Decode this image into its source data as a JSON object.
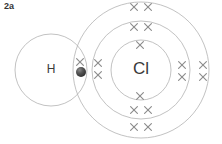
{
  "figure": {
    "label": "2a",
    "type": "dot-and-cross-diagram",
    "molecule": "HCl",
    "background_color": "#ffffff",
    "ring_color": "#b3b3b3",
    "cross_color": "#8c8c8c",
    "symbol_color": "#3a3a3a",
    "dot_color": "#4a4a4a",
    "width": 222,
    "height": 144
  },
  "atoms": [
    {
      "id": "hydrogen",
      "symbol": "H",
      "center_x": 51,
      "center_y": 70,
      "shell_radius": 36,
      "label_x": 51,
      "label_y": 70
    },
    {
      "id": "chlorine",
      "symbol": "Cl",
      "center_x": 141,
      "center_y": 70,
      "label_x": 141,
      "label_y": 70,
      "shells": [
        {
          "name": "inner-shell",
          "radius": 30
        },
        {
          "name": "middle-shell",
          "radius": 49
        },
        {
          "name": "outer-shell",
          "radius": 68
        }
      ]
    }
  ],
  "electrons": {
    "crosses": [
      {
        "name": "cross-bonding-pair",
        "x": 80,
        "y": 62,
        "shell": "outer-shell"
      },
      {
        "name": "cross-inner-top",
        "x": 140,
        "y": 45,
        "shell": "inner-shell"
      },
      {
        "name": "cross-inner-bottom",
        "x": 140,
        "y": 96,
        "shell": "inner-shell"
      },
      {
        "name": "cross-middle-top-left",
        "x": 134,
        "y": 27,
        "shell": "middle-shell"
      },
      {
        "name": "cross-middle-top-right",
        "x": 148,
        "y": 27,
        "shell": "middle-shell"
      },
      {
        "name": "cross-middle-bottom-left",
        "x": 134,
        "y": 110,
        "shell": "middle-shell"
      },
      {
        "name": "cross-middle-bottom-right",
        "x": 148,
        "y": 110,
        "shell": "middle-shell"
      },
      {
        "name": "cross-middle-left-upper",
        "x": 98,
        "y": 63,
        "shell": "middle-shell"
      },
      {
        "name": "cross-middle-left-lower",
        "x": 98,
        "y": 75,
        "shell": "middle-shell"
      },
      {
        "name": "cross-middle-right-upper",
        "x": 182,
        "y": 65,
        "shell": "middle-shell"
      },
      {
        "name": "cross-middle-right-lower",
        "x": 182,
        "y": 77,
        "shell": "middle-shell"
      },
      {
        "name": "cross-outer-top-left",
        "x": 134,
        "y": 7,
        "shell": "outer-shell"
      },
      {
        "name": "cross-outer-top-right",
        "x": 148,
        "y": 7,
        "shell": "outer-shell"
      },
      {
        "name": "cross-outer-bottom-left",
        "x": 134,
        "y": 127,
        "shell": "outer-shell"
      },
      {
        "name": "cross-outer-bottom-right",
        "x": 148,
        "y": 127,
        "shell": "outer-shell"
      },
      {
        "name": "cross-outer-right-upper",
        "x": 203,
        "y": 65,
        "shell": "outer-shell"
      },
      {
        "name": "cross-outer-right-lower",
        "x": 203,
        "y": 77,
        "shell": "outer-shell"
      }
    ],
    "dots": [
      {
        "name": "dot-hydrogen-electron",
        "x": 81,
        "y": 72,
        "radius": 5
      }
    ]
  }
}
